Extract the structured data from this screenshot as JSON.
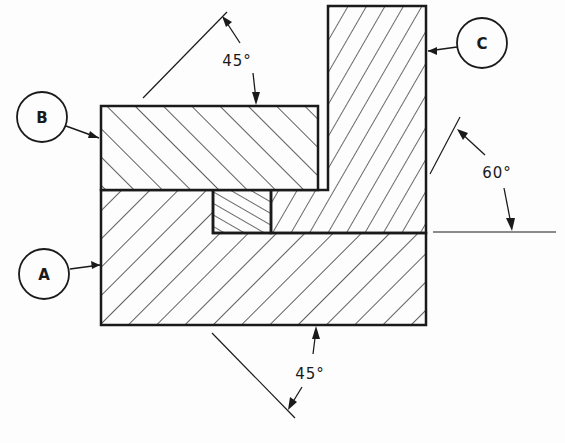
{
  "diagram": {
    "type": "section-view-hatching",
    "parts": [
      {
        "id": "A",
        "label": "A",
        "hatch_angle": "45°",
        "hatch_direction": "down-right"
      },
      {
        "id": "B",
        "label": "B",
        "hatch_angle": "45°",
        "hatch_direction": "up-right"
      },
      {
        "id": "C",
        "label": "C",
        "hatch_angle": "60°",
        "hatch_direction": "up-right"
      }
    ],
    "annotations": {
      "angle_b": "45°",
      "angle_c": "60°",
      "angle_a": "45°"
    },
    "colors": {
      "line": "#1a1a1a",
      "background": "#fdfdfd"
    }
  }
}
